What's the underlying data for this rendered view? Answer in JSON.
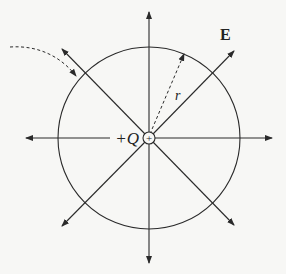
{
  "diagram": {
    "labels": {
      "field": "E",
      "radius": "r",
      "charge": "+Q",
      "charge_symbol": "+"
    },
    "colors": {
      "line": "#2a2a2a",
      "background": "#f7f7f5"
    },
    "geometry": {
      "center": [
        149,
        138
      ],
      "circle_radius": 91,
      "arrow_count": 8
    }
  }
}
